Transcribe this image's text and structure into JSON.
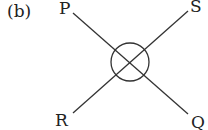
{
  "figure": {
    "part_label": "(b)",
    "line_color": "#333333",
    "points": {
      "top_left": "P",
      "top_right": "S",
      "bottom_left": "R",
      "bottom_right": "Q"
    },
    "center_symbol": "circle-with-cross"
  }
}
